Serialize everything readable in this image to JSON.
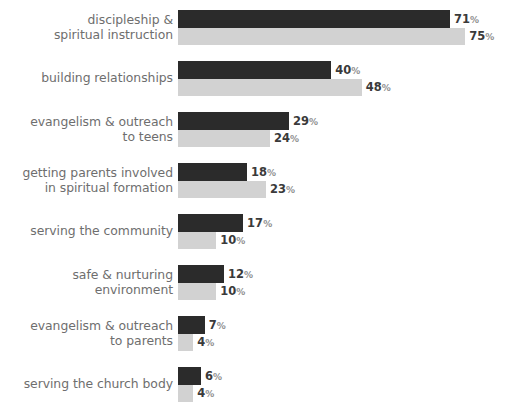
{
  "chart_data": {
    "type": "bar",
    "orientation": "horizontal",
    "title": "",
    "subtitle": "",
    "xlabel": "",
    "ylabel": "",
    "grid": false,
    "legend": null,
    "legend_position": "none",
    "value_suffix": "%",
    "xlim": [
      0,
      75
    ],
    "categories": [
      "discipleship &\nspiritual instruction",
      "building relationships",
      "evangelism & outreach\nto teens",
      "getting parents involved\nin spiritual formation",
      "serving the community",
      "safe & nurturing environment",
      "evangelism & outreach\nto parents",
      "serving the church body"
    ],
    "series": [
      {
        "name": "series-dark",
        "color": "#2b2b2b",
        "values": [
          71,
          40,
          29,
          18,
          17,
          12,
          7,
          6
        ],
        "labels": [
          "71",
          "40",
          "29",
          "18",
          "17",
          "12",
          "7",
          "6"
        ]
      },
      {
        "name": "series-light",
        "color": "#d2d2d2",
        "values": [
          75,
          48,
          24,
          23,
          10,
          10,
          4,
          4
        ],
        "labels": [
          "75",
          "48",
          "24",
          "23",
          "10",
          "10",
          "4",
          "4"
        ]
      }
    ]
  },
  "colors": {
    "dark_bar": "#2b2b2b",
    "light_bar": "#d2d2d2",
    "category_label": "#6e6e6e",
    "value_label": "#3a3a3a",
    "percent_sign": "#8f8f8f",
    "background": "#ffffff"
  }
}
